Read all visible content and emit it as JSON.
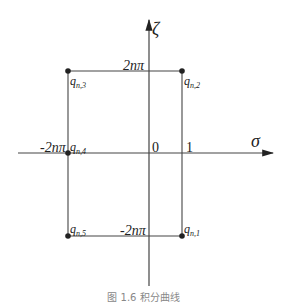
{
  "diagram": {
    "axes": {
      "horizontal_label": "σ",
      "vertical_label": "ζ"
    },
    "labels": {
      "top": "2nπ",
      "bottom": "-2nπ",
      "left": "-2nπ",
      "origin": "0",
      "one": "1"
    },
    "points": [
      {
        "id": "q_n1",
        "base": "q",
        "sub": "n,1"
      },
      {
        "id": "q_n2",
        "base": "q",
        "sub": "n,2"
      },
      {
        "id": "q_n3",
        "base": "q",
        "sub": "n,3"
      },
      {
        "id": "q_n4",
        "base": "q",
        "sub": "n,4"
      },
      {
        "id": "q_n5",
        "base": "q",
        "sub": "n,5"
      }
    ],
    "caption": "图 1.6  积分曲线"
  }
}
